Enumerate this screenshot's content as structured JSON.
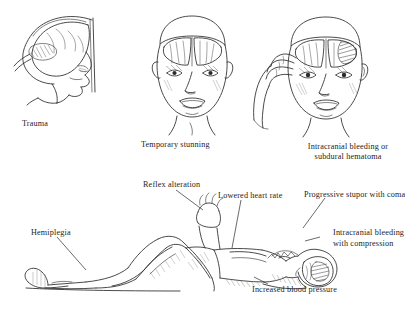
{
  "figure": {
    "panels": [
      {
        "id": "trauma",
        "caption": "Trauma",
        "caption_lines": [
          "Trauma"
        ]
      },
      {
        "id": "temporary-stunning",
        "caption": "Temporary stunning",
        "caption_lines": [
          "Temporary stunning"
        ]
      },
      {
        "id": "intracranial",
        "caption": "Intracranial bleeding or subdural hematoma",
        "caption_lines": [
          "Intracranial bleeding or",
          "subdural hematoma"
        ]
      }
    ],
    "lower_panel": {
      "id": "supine-patient",
      "labels": [
        {
          "id": "hemiplegia",
          "text": "Hemiplegia"
        },
        {
          "id": "reflex-alteration",
          "text": "Reflex alteration"
        },
        {
          "id": "lowered-heart-rate",
          "text": "Lowered heart rate"
        },
        {
          "id": "progressive-stupor",
          "text": "Progressive stupor with coma"
        },
        {
          "id": "intracranial-compression-1",
          "text": "Intracranial bleeding"
        },
        {
          "id": "intracranial-compression-2",
          "text": "with compression"
        },
        {
          "id": "increased-blood-pressure",
          "text": "Increased blood pressure"
        }
      ]
    },
    "colors": {
      "ink": "#2b2b2b",
      "text": "#242424",
      "background": "#ffffff",
      "shading": "#6f6f6f"
    }
  }
}
